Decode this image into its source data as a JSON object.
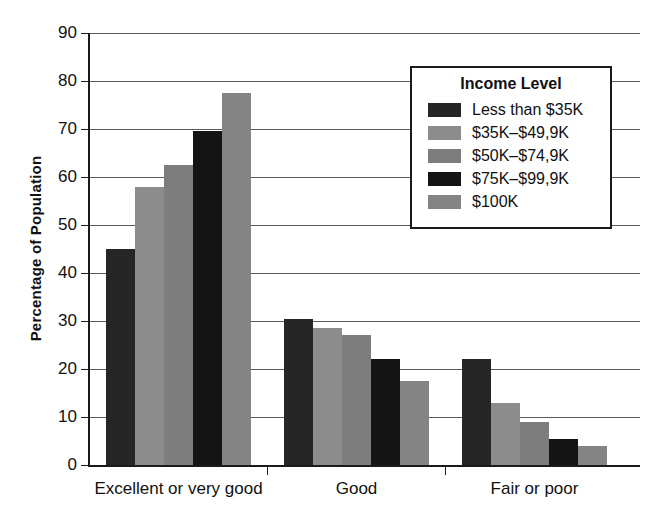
{
  "chart_data": {
    "type": "bar",
    "title": "",
    "subtitle": "",
    "xlabel": "",
    "ylabel": "Percentage of Population",
    "ylim": [
      0,
      90
    ],
    "ytick_step": 10,
    "yticks": [
      0,
      10,
      20,
      30,
      40,
      50,
      60,
      70,
      80,
      90
    ],
    "ytick_labels": [
      "0",
      "10",
      "20",
      "30",
      "40",
      "50",
      "60",
      "70",
      "80",
      "90"
    ],
    "grid": true,
    "grid_axis": "y",
    "categories": [
      "Excellent or very good",
      "Good",
      "Fair or poor"
    ],
    "legend_title": "Income Level",
    "legend_position": "upper right (inside plot)",
    "series": [
      {
        "name": "Less than $35K",
        "color": "#262626",
        "values": [
          45,
          30.5,
          22
        ]
      },
      {
        "name": "$35K–$49,9K",
        "color": "#8c8c8c",
        "values": [
          58,
          28.5,
          13
        ]
      },
      {
        "name": "$50K–$74,9K",
        "color": "#7d7d7d",
        "values": [
          62.5,
          27,
          9
        ]
      },
      {
        "name": "$75K–$99,9K",
        "color": "#141414",
        "values": [
          69.5,
          22,
          5.5
        ]
      },
      {
        "name": "$100K",
        "color": "#848484",
        "values": [
          77.5,
          17.5,
          4
        ]
      }
    ]
  },
  "axis": {
    "ylabel": "Percentage of Population"
  },
  "legend": {
    "title": "Income Level"
  }
}
